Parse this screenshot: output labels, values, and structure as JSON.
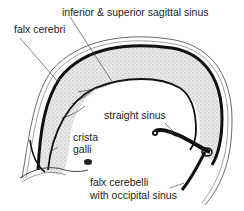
{
  "figure": {
    "colors": {
      "background": "#ffffff",
      "ink": "#1a1a1a",
      "stipple": "#cfcfcf",
      "label_text": "#222222"
    }
  },
  "labels": {
    "sagittal_sinus": "inferior & superior  sagittal sinus",
    "falx_cerebri": "falx cerebri",
    "straight_sinus": "straight sinus",
    "crista_line1": "crista",
    "crista_line2": "galli",
    "falx_cerebelli_line1": "falx cerebelli",
    "falx_cerebelli_line2": "with occipital sinus"
  }
}
